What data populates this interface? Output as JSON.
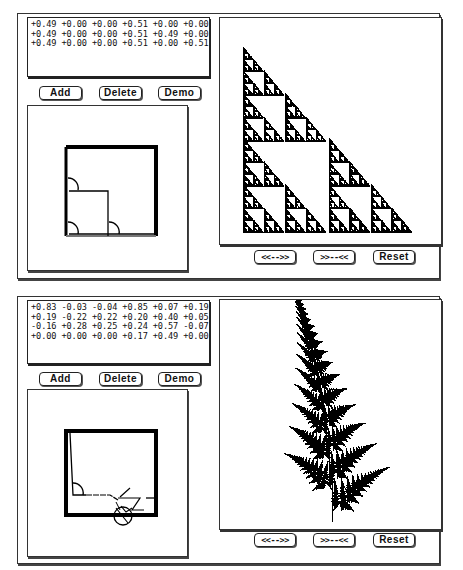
{
  "windows": [
    {
      "name": "sierpinski",
      "coefficients": [
        "+0.49 +0.00 +0.00 +0.51 +0.00 +0.00",
        "+0.49 +0.00 +0.00 +0.51 +0.49 +0.00",
        "+0.49 +0.00 +0.00 +0.51 +0.00 +0.51"
      ],
      "buttons": {
        "add": "Add",
        "delete": "Delete",
        "demo": "Demo"
      },
      "display_buttons": {
        "expand": "<<-->>",
        "shrink": ">>--<<",
        "reset": "Reset"
      },
      "display_image": "sierpinski-triangle",
      "map_editor_image": "three-square-maps"
    },
    {
      "name": "fern",
      "coefficients": [
        "+0.83 -0.03 -0.04 +0.85 +0.07 +0.19",
        "+0.19 -0.22 +0.22 +0.20 +0.40 +0.05",
        "-0.16 +0.28 +0.25 +0.24 +0.57 -0.07",
        "+0.00 +0.00 +0.00 +0.17 +0.49 +0.00"
      ],
      "buttons": {
        "add": "Add",
        "delete": "Delete",
        "demo": "Demo"
      },
      "display_buttons": {
        "expand": "<<-->>",
        "shrink": ">>--<<",
        "reset": "Reset"
      },
      "display_image": "barnsley-fern",
      "map_editor_image": "four-fern-maps"
    }
  ]
}
